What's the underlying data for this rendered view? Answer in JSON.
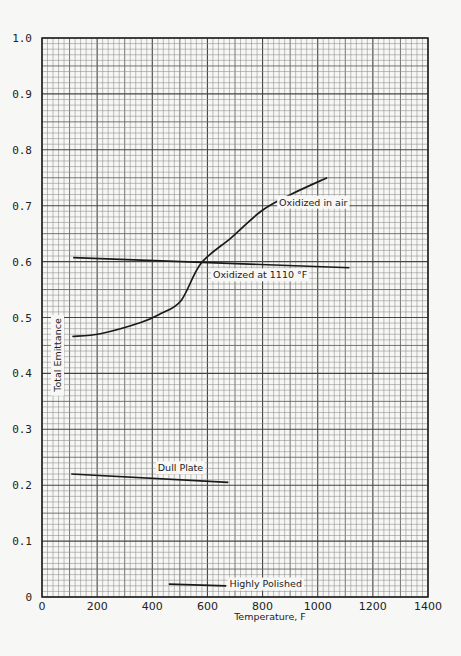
{
  "chart_data": {
    "type": "line",
    "title": "",
    "xlabel": "Temperature, F",
    "ylabel": "Total Emittance",
    "xlim": [
      0,
      1400
    ],
    "ylim": [
      0,
      1.0
    ],
    "x_ticks": [
      "0",
      "200",
      "400",
      "600",
      "800",
      "1000",
      "1200",
      "1400"
    ],
    "y_ticks": [
      "0",
      "0.1",
      "0.2",
      "0.3",
      "0.4",
      "0.5",
      "0.6",
      "0.7",
      "0.8",
      "0.9",
      "1.0"
    ],
    "grid": true,
    "legend_position": "inline labels",
    "series": [
      {
        "name": "Oxidized in air",
        "x": [
          110,
          212,
          358,
          431,
          504,
          577,
          687,
          797,
          906,
          1034
        ],
        "y": [
          0.466,
          0.471,
          0.491,
          0.507,
          0.53,
          0.597,
          0.643,
          0.691,
          0.721,
          0.75
        ]
      },
      {
        "name": "Oxidized at 1110 °F",
        "x": [
          113,
          1115
        ],
        "y": [
          0.607,
          0.589
        ]
      },
      {
        "name": "Dull Plate",
        "x": [
          106,
          676
        ],
        "y": [
          0.22,
          0.205
        ]
      },
      {
        "name": "Highly Polished",
        "x": [
          460,
          668
        ],
        "y": [
          0.023,
          0.02
        ]
      }
    ],
    "annotations": [
      {
        "text": "Oxidized in air",
        "x": 860,
        "y": 0.7
      },
      {
        "text": "Oxidized at 1110 °F",
        "x": 620,
        "y": 0.57
      },
      {
        "text": "Dull Plate",
        "x": 420,
        "y": 0.225
      },
      {
        "text": "Highly Polished",
        "x": 680,
        "y": 0.017
      }
    ]
  },
  "labels": {
    "xlabel": "Temperature, F",
    "ylabel": "Total Emittance",
    "oxidized_air": "Oxidized in air",
    "oxidized_1110": "Oxidized at 1110 °F",
    "dull_plate": "Dull Plate",
    "highly_polished": "Highly Polished"
  }
}
